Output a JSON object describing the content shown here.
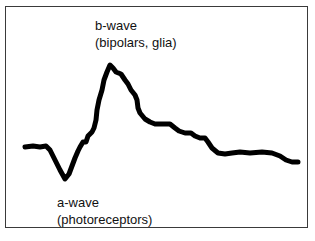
{
  "diagram": {
    "labels": {
      "b_wave": {
        "line1": "b-wave",
        "line2": "(bipolars, glia)"
      },
      "a_wave": {
        "line1": "a-wave",
        "line2": "(photoreceptors)"
      }
    },
    "curve_color": "#000000",
    "frame_color": "#3a3a3a"
  }
}
